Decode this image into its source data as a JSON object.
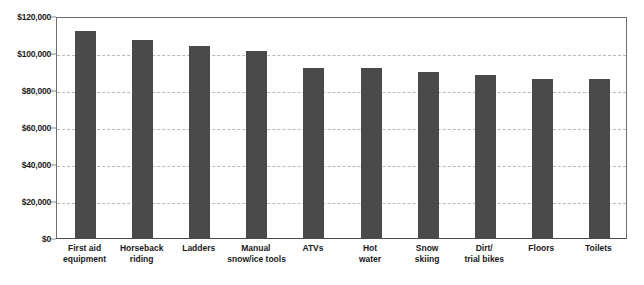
{
  "chart_data": {
    "type": "bar",
    "title": "",
    "subtitle": "",
    "xlabel": "",
    "ylabel": "",
    "ylim": [
      0,
      120000
    ],
    "ytick_values": [
      0,
      20000,
      40000,
      60000,
      80000,
      100000,
      120000
    ],
    "ytick_labels": [
      "$0",
      "$20,000",
      "$40,000",
      "$60,000",
      "$80,000",
      "$100,000",
      "$120,000"
    ],
    "grid": "horizontal-dashed",
    "legend": "none",
    "categories": [
      "First aid equipment",
      "Horseback riding",
      "Ladders",
      "Manual snow/ice tools",
      "ATVs",
      "Hot water",
      "Snow skiing",
      "Dirt/ trial bikes",
      "Floors",
      "Toilets"
    ],
    "category_label_lines": [
      [
        "First aid",
        "equipment"
      ],
      [
        "Horseback",
        "riding"
      ],
      [
        "Ladders"
      ],
      [
        "Manual",
        "snow/ice tools"
      ],
      [
        "ATVs"
      ],
      [
        "Hot",
        "water"
      ],
      [
        "Snow",
        "skiing"
      ],
      [
        "Dirt/",
        "trial bikes"
      ],
      [
        "Floors"
      ],
      [
        "Toilets"
      ]
    ],
    "values": [
      112000,
      107000,
      104000,
      101000,
      92000,
      92000,
      90000,
      88000,
      86000,
      86000
    ],
    "bar_color": "#4a4a4a",
    "gridline_color": "#b9b9b9",
    "axis_color": "#6e6e6e",
    "background_color": "#ffffff"
  }
}
